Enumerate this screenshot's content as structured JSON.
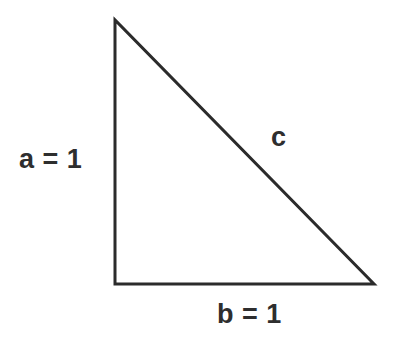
{
  "figure": {
    "type": "right-triangle-diagram",
    "background_color": "#ffffff",
    "stroke_color": "#2b2b2b",
    "stroke_width": 3,
    "text_color": "#2e2e2e",
    "vertices": {
      "apex": {
        "x": 115,
        "y": 20
      },
      "right_angle": {
        "x": 115,
        "y": 284
      },
      "bottom_right": {
        "x": 374,
        "y": 284
      }
    },
    "labels": {
      "leg_a": "a = 1",
      "leg_b": "b = 1",
      "hypotenuse_c": "c"
    }
  },
  "chart_data": {
    "type": "diagram",
    "title": "",
    "subtitle": "",
    "xlabel": "",
    "ylabel": "",
    "shape": "right triangle",
    "categories": [
      "a",
      "b",
      "c"
    ],
    "values": [
      1,
      1,
      null
    ],
    "annotations": [
      {
        "name": "a",
        "text": "a = 1",
        "value": 1,
        "side": "vertical-leg",
        "position": "left-outside",
        "x": 19,
        "y": 146
      },
      {
        "name": "b",
        "text": "b = 1",
        "value": 1,
        "side": "horizontal-leg",
        "position": "below-outside",
        "x": 217,
        "y": 301
      },
      {
        "name": "c",
        "text": "c",
        "value": null,
        "side": "hypotenuse",
        "position": "above-right",
        "x": 271,
        "y": 124
      }
    ],
    "legend": [],
    "grid": false
  }
}
